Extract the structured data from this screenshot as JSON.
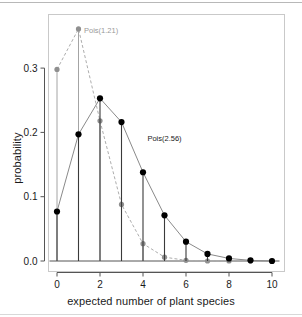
{
  "chart_data": {
    "type": "line",
    "title": "",
    "xlabel": "expected number of plant species",
    "ylabel": "probability",
    "xlim": [
      -0.35,
      10.35
    ],
    "ylim": [
      0.0,
      0.375
    ],
    "grid": false,
    "legend_position": "inline-annotation",
    "x": [
      0,
      1,
      2,
      3,
      4,
      5,
      6,
      7,
      8,
      9,
      10
    ],
    "xticks": [
      0,
      2,
      4,
      6,
      8,
      10
    ],
    "xticklabels": [
      "0",
      "2",
      "4",
      "6",
      "8",
      "10"
    ],
    "yticks": [
      0.0,
      0.1,
      0.2,
      0.3
    ],
    "yticklabels": [
      "0.0",
      "0.1",
      "0.2",
      "0.3"
    ],
    "series": [
      {
        "name": "Pois(1.21)",
        "color": "#999999",
        "linestyle": "dashed",
        "marker": "circle",
        "lambda": 1.21,
        "values": [
          0.298,
          0.361,
          0.218,
          0.088,
          0.027,
          0.006,
          0.001,
          0.0,
          0.0,
          0.0,
          0.0
        ]
      },
      {
        "name": "Pois(2.56)",
        "color": "#000000",
        "linestyle": "solid",
        "marker": "filled-circle",
        "lambda": 2.56,
        "values": [
          0.077,
          0.197,
          0.253,
          0.216,
          0.138,
          0.071,
          0.03,
          0.011,
          0.004,
          0.001,
          0.0
        ]
      }
    ],
    "annotations": [
      {
        "text": "Pois(1.21)",
        "x": 2.05,
        "y": 0.354,
        "color": "#999999"
      },
      {
        "text": "Pois(2.56)",
        "x": 5.0,
        "y": 0.187,
        "color": "#1a1a1a"
      }
    ]
  }
}
